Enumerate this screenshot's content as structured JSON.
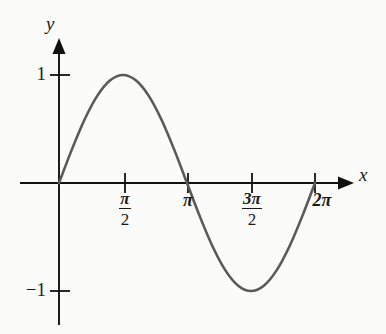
{
  "figure": {
    "background_color": "#fbfbf9",
    "width": 386,
    "height": 334
  },
  "axes": {
    "x_label": "x",
    "y_label": "y",
    "axis_color": "#111111",
    "origin_px": [
      59,
      183
    ],
    "x_arrow": true,
    "y_arrow": true
  },
  "ticks": {
    "x": [
      {
        "label_plain": "π/2",
        "kind": "fraction",
        "numerator": "π",
        "denominator": "2",
        "value_px": 125,
        "value": 1.5707963
      },
      {
        "label_plain": "π",
        "kind": "plain",
        "text": "π",
        "value_px": 188,
        "value": 3.1415927
      },
      {
        "label_plain": "3π/2",
        "kind": "fraction",
        "numerator": "3π",
        "denominator": "2",
        "value_px": 252,
        "value": 4.712389
      },
      {
        "label_plain": "2π",
        "kind": "plain",
        "text": "2π",
        "value_px": 315,
        "value": 6.2831853
      }
    ],
    "y": [
      {
        "text": "1",
        "value": 1,
        "value_px": 75
      },
      {
        "text": "−1",
        "value": -1,
        "value_px": 291
      }
    ]
  },
  "chart_data": {
    "type": "line",
    "title": "",
    "subtitle": "",
    "xlabel": "x",
    "ylabel": "y",
    "grid": false,
    "legend": null,
    "legend_position": "none",
    "xlim": [
      0,
      6.2831853
    ],
    "ylim": [
      -1,
      1
    ],
    "xticks": [
      1.5707963,
      3.1415927,
      4.712389,
      6.2831853
    ],
    "xticklabels": [
      "π/2",
      "π",
      "3π/2",
      "2π"
    ],
    "yticks": [
      1,
      -1
    ],
    "yticklabels": [
      "1",
      "−1"
    ],
    "series": [
      {
        "name": "y = sin x",
        "color": "#5a5a5a",
        "linewidth": 2.6,
        "x": [
          0,
          0.3141593,
          0.6283185,
          0.9424778,
          1.2566371,
          1.5707963,
          1.8849556,
          2.1991149,
          2.5132741,
          2.8274334,
          3.1415927,
          3.4557519,
          3.7699112,
          4.0840704,
          4.3982297,
          4.712389,
          5.0265482,
          5.3407075,
          5.6548668,
          5.969026,
          6.2831853
        ],
        "y": [
          0,
          0.309017,
          0.5877853,
          0.809017,
          0.9510565,
          1,
          0.9510565,
          0.809017,
          0.5877853,
          0.309017,
          0,
          -0.309017,
          -0.5877853,
          -0.809017,
          -0.9510565,
          -1,
          -0.9510565,
          -0.809017,
          -0.5877853,
          -0.309017,
          0
        ]
      }
    ],
    "annotations": [
      {
        "text": "maximum",
        "x": 1.5707963,
        "y": 1
      },
      {
        "text": "minimum",
        "x": 4.712389,
        "y": -1
      }
    ]
  }
}
